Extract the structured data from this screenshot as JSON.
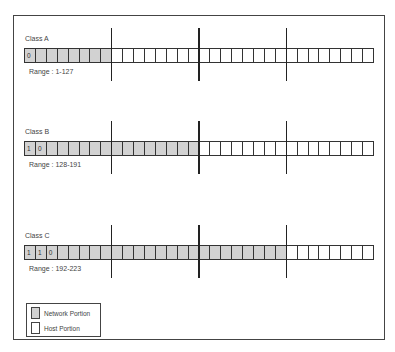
{
  "colors": {
    "network": "#d2d2d2",
    "host": "#ffffff",
    "line": "#333333"
  },
  "bits_total": 32,
  "octet_dividers_after_bits": [
    8,
    16,
    24
  ],
  "classes": [
    {
      "label": "Class A",
      "range": "Range : 1-127",
      "network_bits": 8,
      "leading_bits": [
        "0"
      ],
      "label_top": 35,
      "bar_top": 48,
      "range_top": 68,
      "div_top": 28,
      "div_h": 53
    },
    {
      "label": "Class B",
      "range": "Range : 128-191",
      "network_bits": 16,
      "leading_bits": [
        "1",
        "0"
      ],
      "label_top": 128,
      "bar_top": 141,
      "range_top": 161,
      "div_top": 121,
      "div_h": 53
    },
    {
      "label": "Class C",
      "range": "Range : 192-223",
      "network_bits": 24,
      "leading_bits": [
        "1",
        "1",
        "0"
      ],
      "label_top": 232,
      "bar_top": 245,
      "range_top": 265,
      "div_top": 225,
      "div_h": 53
    }
  ],
  "legend": {
    "items": [
      {
        "label": "Network Portion",
        "swatch": "network"
      },
      {
        "label": "Host Portion",
        "swatch": "host"
      }
    ]
  }
}
